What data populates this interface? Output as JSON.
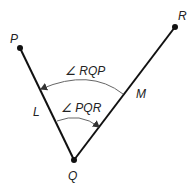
{
  "diagram": {
    "type": "angle-diagram",
    "colors": {
      "line": "#111111",
      "arc": "#666666",
      "text": "#222222",
      "background": "#ffffff"
    },
    "points": [
      {
        "id": "P",
        "label": "P",
        "x": 20,
        "y": 48
      },
      {
        "id": "Q",
        "label": "Q",
        "x": 74,
        "y": 160
      },
      {
        "id": "R",
        "label": "R",
        "x": 175,
        "y": 27
      }
    ],
    "segments": [
      {
        "from": "Q",
        "to": "P"
      },
      {
        "from": "Q",
        "to": "R"
      }
    ],
    "side_labels": {
      "L": "L",
      "M": "M"
    },
    "angles": [
      {
        "name": "RQP",
        "label": "∠ RQP",
        "direction": "from QR to QP (counterclockwise)"
      },
      {
        "name": "PQR",
        "label": "∠ PQR",
        "direction": "from QP to QR (clockwise)"
      }
    ]
  }
}
